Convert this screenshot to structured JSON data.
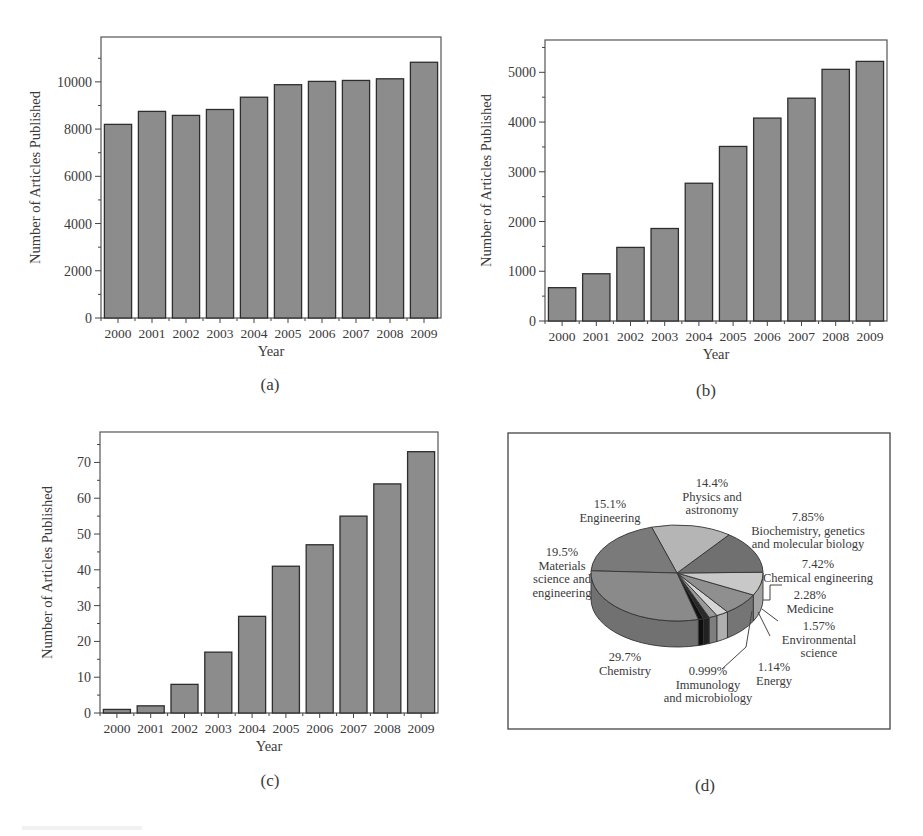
{
  "figure": {
    "captions": [
      "(a)",
      "(b)",
      "(c)",
      "(d)"
    ]
  },
  "chart_data": [
    {
      "id": "a",
      "type": "bar",
      "title": "",
      "xlabel": "Year",
      "ylabel": "Number of Articles Published",
      "categories": [
        "2000",
        "2001",
        "2002",
        "2003",
        "2004",
        "2005",
        "2006",
        "2007",
        "2008",
        "2009"
      ],
      "values": [
        8200,
        8750,
        8580,
        8830,
        9350,
        9880,
        10020,
        10060,
        10130,
        10830
      ],
      "yticks": [
        0,
        2000,
        4000,
        6000,
        8000,
        10000
      ],
      "ylim": [
        0,
        11900
      ],
      "grid": false,
      "bar_color": "#8c8c8c"
    },
    {
      "id": "b",
      "type": "bar",
      "title": "",
      "xlabel": "Year",
      "ylabel": "Number of Articles Published",
      "categories": [
        "2000",
        "2001",
        "2002",
        "2003",
        "2004",
        "2005",
        "2006",
        "2007",
        "2008",
        "2009"
      ],
      "values": [
        670,
        950,
        1480,
        1860,
        2770,
        3510,
        4080,
        4480,
        5060,
        5220
      ],
      "yticks": [
        0,
        1000,
        2000,
        3000,
        4000,
        5000
      ],
      "ylim": [
        0,
        5650
      ],
      "grid": false,
      "bar_color": "#8c8c8c"
    },
    {
      "id": "c",
      "type": "bar",
      "title": "",
      "xlabel": "Year",
      "ylabel": "Number of Articles Published",
      "categories": [
        "2000",
        "2001",
        "2002",
        "2003",
        "2004",
        "2005",
        "2006",
        "2007",
        "2008",
        "2009"
      ],
      "values": [
        1,
        2,
        8,
        17,
        27,
        41,
        47,
        55,
        64,
        73
      ],
      "yticks": [
        0,
        10,
        20,
        30,
        40,
        50,
        60,
        70
      ],
      "ylim": [
        0,
        78.5
      ],
      "grid": false,
      "bar_color": "#8c8c8c"
    },
    {
      "id": "d",
      "type": "pie",
      "title": "",
      "style": "3d",
      "slices": [
        {
          "label": "Chemistry",
          "pct_label": "29.7%",
          "value": 29.7,
          "color": "#8a8a8a"
        },
        {
          "label": "Materials science and engineering",
          "pct_label": "19.5%",
          "value": 19.5,
          "color": "#7a7a7a"
        },
        {
          "label": "Engineering",
          "pct_label": "15.1%",
          "value": 15.1,
          "color": "#b5b5b5"
        },
        {
          "label": "Physics and astronomy",
          "pct_label": "14.4%",
          "value": 14.4,
          "color": "#707070"
        },
        {
          "label": "Biochemistry, genetics and molecular biology",
          "pct_label": "7.85%",
          "value": 7.85,
          "color": "#c8c8c8"
        },
        {
          "label": "Chemical engineering",
          "pct_label": "7.42%",
          "value": 7.42,
          "color": "#8f8f8f"
        },
        {
          "label": "Medicine",
          "pct_label": "2.28%",
          "value": 2.28,
          "color": "#d6d6d6"
        },
        {
          "label": "Environmental science",
          "pct_label": "1.57%",
          "value": 1.57,
          "color": "#9a9a9a"
        },
        {
          "label": "Energy",
          "pct_label": "1.14%",
          "value": 1.14,
          "color": "#2a2a2a"
        },
        {
          "label": "Immunology and microbiology",
          "pct_label": "0.999%",
          "value": 0.999,
          "color": "#111111"
        }
      ],
      "annotations": [
        {
          "pct": "15.1%",
          "lines": [
            "Engineering"
          ]
        },
        {
          "pct": "14.4%",
          "lines": [
            "Physics and",
            "astronomy"
          ]
        },
        {
          "pct": "7.85%",
          "lines": [
            "Biochemistry, genetics",
            "and molecular biology"
          ]
        },
        {
          "pct": "19.5%",
          "lines": [
            "Materials",
            "science and",
            "engineering"
          ]
        },
        {
          "pct": "7.42%",
          "lines": [
            "Chemical engineering"
          ]
        },
        {
          "pct": "2.28%",
          "lines": [
            "Medicine"
          ]
        },
        {
          "pct": "1.57%",
          "lines": [
            "Environmental",
            "science"
          ]
        },
        {
          "pct": "29.7%",
          "lines": [
            "Chemistry"
          ]
        },
        {
          "pct": "1.14%",
          "lines": [
            "Energy"
          ]
        },
        {
          "pct": "0.999%",
          "lines": [
            "Immunology",
            "and microbiology"
          ]
        }
      ]
    }
  ]
}
